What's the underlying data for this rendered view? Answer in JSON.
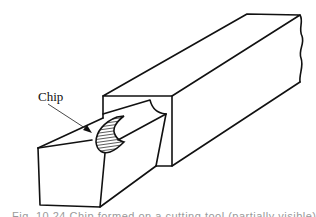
{
  "figure": {
    "labels": {
      "chip": "Chip"
    },
    "caption": "Fig. 10.24   Chip formed on a cutting tool (partially visible)",
    "colors": {
      "line": "#111111",
      "background": "#ffffff",
      "hatch": "#333333"
    }
  }
}
